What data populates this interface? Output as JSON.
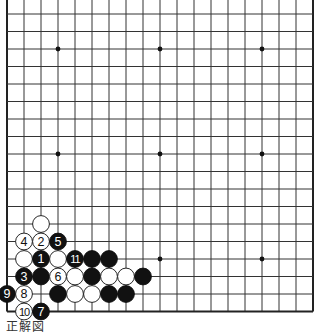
{
  "board": {
    "size": 19,
    "origin_x": 7,
    "origin_y": -3.5,
    "spacing_x": 17,
    "spacing_y": 17.5,
    "stone_radius": 8.4,
    "line_color": "#333333",
    "edge_color": "#222222",
    "background": "#ffffff",
    "black_color": "#111111",
    "white_color": "#ffffff",
    "visible_edges": [
      "left",
      "right",
      "bottom"
    ],
    "star_points": [
      [
        3,
        3
      ],
      [
        9,
        3
      ],
      [
        15,
        3
      ],
      [
        3,
        9
      ],
      [
        9,
        9
      ],
      [
        15,
        9
      ],
      [
        3,
        15
      ],
      [
        9,
        15
      ],
      [
        15,
        15
      ]
    ],
    "stones": [
      {
        "col": 2,
        "row": 13,
        "color": "white",
        "label": ""
      },
      {
        "col": 1,
        "row": 14,
        "color": "white",
        "label": "4"
      },
      {
        "col": 2,
        "row": 14,
        "color": "white",
        "label": "2"
      },
      {
        "col": 3,
        "row": 14,
        "color": "black",
        "label": "5"
      },
      {
        "col": 1,
        "row": 15,
        "color": "white",
        "label": ""
      },
      {
        "col": 2,
        "row": 15,
        "color": "black",
        "label": "1"
      },
      {
        "col": 3,
        "row": 15,
        "color": "white",
        "label": ""
      },
      {
        "col": 4,
        "row": 15,
        "color": "black",
        "label": "11"
      },
      {
        "col": 5,
        "row": 15,
        "color": "black",
        "label": ""
      },
      {
        "col": 6,
        "row": 15,
        "color": "black",
        "label": ""
      },
      {
        "col": 1,
        "row": 16,
        "color": "black",
        "label": "3"
      },
      {
        "col": 2,
        "row": 16,
        "color": "black",
        "label": ""
      },
      {
        "col": 3,
        "row": 16,
        "color": "white",
        "label": "6"
      },
      {
        "col": 4,
        "row": 16,
        "color": "white",
        "label": ""
      },
      {
        "col": 5,
        "row": 16,
        "color": "black",
        "label": ""
      },
      {
        "col": 6,
        "row": 16,
        "color": "white",
        "label": ""
      },
      {
        "col": 7,
        "row": 16,
        "color": "white",
        "label": ""
      },
      {
        "col": 8,
        "row": 16,
        "color": "black",
        "label": ""
      },
      {
        "col": 0,
        "row": 17,
        "color": "black",
        "label": "9"
      },
      {
        "col": 1,
        "row": 17,
        "color": "white",
        "label": "8"
      },
      {
        "col": 3,
        "row": 17,
        "color": "black",
        "label": ""
      },
      {
        "col": 4,
        "row": 17,
        "color": "white",
        "label": ""
      },
      {
        "col": 5,
        "row": 17,
        "color": "white",
        "label": ""
      },
      {
        "col": 6,
        "row": 17,
        "color": "black",
        "label": ""
      },
      {
        "col": 7,
        "row": 17,
        "color": "black",
        "label": ""
      },
      {
        "col": 1,
        "row": 18,
        "color": "white",
        "label": "10"
      },
      {
        "col": 2,
        "row": 18,
        "color": "black",
        "label": "7"
      }
    ]
  },
  "caption": {
    "text": "正解図"
  }
}
